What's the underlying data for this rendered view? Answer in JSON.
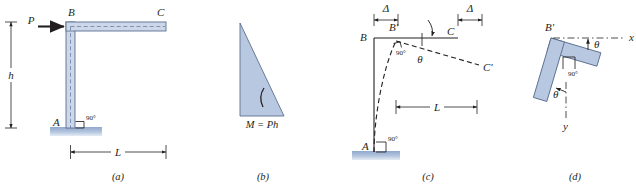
{
  "figure": {
    "kind": "engineering-mechanics-figure",
    "colors": {
      "member_fill": "#b8c8e0",
      "member_fill_light": "#ccd8ea",
      "member_outline": "#5c6f90",
      "line": "#231f20",
      "ground": "#9fb4d6",
      "centerline": "#6b7fa0"
    }
  },
  "panels": [
    {
      "id": "a",
      "caption": "(a)",
      "labels": {
        "force": "P",
        "corner": "B",
        "tip": "C",
        "base": "A",
        "height": "h",
        "span": "L",
        "angle": "90°"
      }
    },
    {
      "id": "b",
      "caption": "(b)",
      "labels": {
        "moment": "M = Ph"
      }
    },
    {
      "id": "c",
      "caption": "(c)",
      "labels": {
        "corner": "B",
        "corner_displaced": "B'",
        "tip": "C",
        "tip_displaced": "C'",
        "base": "A",
        "deflection_left": "Δ",
        "deflection_right": "Δ",
        "span": "L",
        "angle_base": "90°",
        "angle_corner": "90°",
        "rotation": "θ"
      }
    },
    {
      "id": "d",
      "caption": "(d)",
      "labels": {
        "corner_displaced": "B'",
        "axis_x": "x",
        "axis_y": "y",
        "angle_x": "θ",
        "angle_y": "θ",
        "angle_corner": "90°"
      }
    }
  ]
}
